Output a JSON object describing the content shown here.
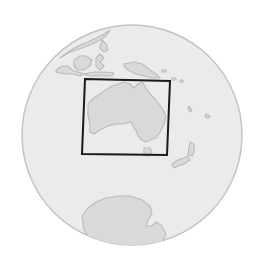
{
  "map": {
    "type": "locator-globe",
    "region_highlighted": "Australia",
    "colors": {
      "background": "#ffffff",
      "ocean": "#ebebeb",
      "land": "#d9d9d9",
      "coastline": "#bcbcbc",
      "globe_outline": "#c4c4c4",
      "extent_box": "#1a1a1a"
    },
    "globe": {
      "cx": 132,
      "cy": 135,
      "r": 110
    },
    "extent_box": {
      "corners": [
        [
          85,
          79
        ],
        [
          170,
          81
        ],
        [
          167,
          155
        ],
        [
          82,
          154
        ]
      ]
    },
    "landmasses": [
      "Southeast Asia",
      "New Guinea",
      "Australia",
      "Tasmania",
      "New Zealand",
      "Pacific Islands",
      "Antarctica"
    ]
  }
}
